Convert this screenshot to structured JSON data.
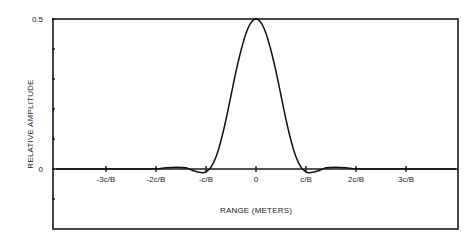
{
  "chart_data": {
    "type": "line",
    "title": "",
    "xlabel": "RANGE (METERS)",
    "ylabel": "RELATIVE AMPLITUDE",
    "xlim": [
      -4.06,
      4.04
    ],
    "ylim": [
      -0.2,
      0.5
    ],
    "x_unit": "c/B",
    "grid": false,
    "legend": null,
    "x_ticks": [
      {
        "value": -3,
        "label": "-3c/B"
      },
      {
        "value": -2,
        "label": "-2c/B"
      },
      {
        "value": -1,
        "label": "-c/B"
      },
      {
        "value": 0,
        "label": "0"
      },
      {
        "value": 1,
        "label": "c/B"
      },
      {
        "value": 2,
        "label": "2c/B"
      },
      {
        "value": 3,
        "label": "3c/B"
      }
    ],
    "y_ticks": [
      {
        "value": 0.5,
        "label": "0.5"
      },
      {
        "value": 0.4,
        "label": ""
      },
      {
        "value": 0.3,
        "label": ""
      },
      {
        "value": 0.2,
        "label": ""
      },
      {
        "value": 0.1,
        "label": ""
      },
      {
        "value": 0,
        "label": "0"
      },
      {
        "value": -0.1,
        "label": ""
      }
    ],
    "series": [
      {
        "name": "Range response",
        "x": [
          -4.0,
          -3.5,
          -3.0,
          -2.6,
          -2.3,
          -2.0,
          -1.8,
          -1.6,
          -1.4,
          -1.25,
          -1.1,
          -1.0,
          -0.9,
          -0.8,
          -0.7,
          -0.6,
          -0.5,
          -0.4,
          -0.3,
          -0.2,
          -0.1,
          0.0,
          0.1,
          0.2,
          0.3,
          0.4,
          0.5,
          0.6,
          0.7,
          0.8,
          0.9,
          1.0,
          1.1,
          1.25,
          1.4,
          1.6,
          1.8,
          2.0,
          2.3,
          2.6,
          3.0,
          3.5,
          4.0
        ],
        "values": [
          0.0,
          0.0,
          0.0,
          0.0,
          0.0,
          0.0,
          0.004,
          0.006,
          0.004,
          -0.006,
          -0.012,
          -0.01,
          0.006,
          0.04,
          0.095,
          0.165,
          0.245,
          0.325,
          0.395,
          0.452,
          0.488,
          0.5,
          0.488,
          0.452,
          0.395,
          0.325,
          0.245,
          0.165,
          0.095,
          0.04,
          0.006,
          -0.01,
          -0.012,
          -0.006,
          0.004,
          0.006,
          0.004,
          0.0,
          0.0,
          0.0,
          0.0,
          0.0,
          0.0
        ]
      }
    ]
  },
  "plot": {
    "x_zero_px": 256,
    "x_unit_px": 50,
    "y_zero_px": 169,
    "y_unit_px": 300,
    "frame": {
      "left": 53,
      "top": 19,
      "right": 458,
      "bottom": 229
    }
  }
}
